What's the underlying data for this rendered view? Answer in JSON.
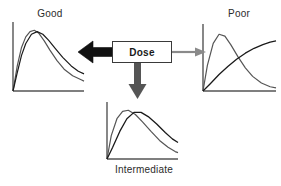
{
  "figure": {
    "title": "",
    "center_node": {
      "label": "Dose",
      "border_color": "#3a3a3a",
      "fill_color": "#ffffff"
    }
  },
  "arrows": [
    {
      "name": "arrow-to-good",
      "direction": "left",
      "style": "thick-solid",
      "color": "#111111",
      "target": "Good"
    },
    {
      "name": "arrow-to-poor",
      "direction": "right",
      "style": "thin",
      "color": "#8a8a8a",
      "target": "Poor"
    },
    {
      "name": "arrow-to-intermediate",
      "direction": "down",
      "style": "medium",
      "color": "#555555",
      "target": "Intermediate"
    }
  ],
  "panels": [
    {
      "id": "good",
      "label": "Good"
    },
    {
      "id": "poor",
      "label": "Poor"
    },
    {
      "id": "intermediate",
      "label": "Intermediate"
    }
  ],
  "chart_data": [
    {
      "id": "good",
      "type": "line",
      "title": "Good",
      "xlabel": "",
      "ylabel": "",
      "grid": false,
      "legend": "none",
      "axes": {
        "x_axis": true,
        "y_axis": true,
        "ticks": false
      },
      "xlim": [
        0,
        100
      ],
      "ylim": [
        0,
        100
      ],
      "annotation": "Two concentration-time curves peak at nearly the same time and height (overlapping response).",
      "series": [
        {
          "name": "curve-1",
          "color": "#555555",
          "x": [
            0,
            6,
            12,
            18,
            24,
            30,
            36,
            44,
            52,
            62,
            72,
            84,
            96,
            100
          ],
          "y": [
            0,
            38,
            66,
            82,
            90,
            92,
            88,
            76,
            62,
            46,
            33,
            23,
            17,
            15
          ]
        },
        {
          "name": "curve-2",
          "color": "#1a1a1a",
          "x": [
            0,
            6,
            12,
            18,
            26,
            34,
            42,
            50,
            60,
            70,
            82,
            92,
            100
          ],
          "y": [
            0,
            28,
            54,
            72,
            86,
            90,
            86,
            77,
            64,
            51,
            38,
            30,
            26
          ]
        }
      ]
    },
    {
      "id": "poor",
      "type": "line",
      "title": "Poor",
      "xlabel": "",
      "ylabel": "",
      "grid": false,
      "legend": "none",
      "axes": {
        "x_axis": true,
        "y_axis": true,
        "ticks": false
      },
      "xlim": [
        0,
        100
      ],
      "ylim": [
        0,
        100
      ],
      "annotation": "One curve peaks early then falls to near zero; the other rises slowly and plateaus high (curves cross).",
      "series": [
        {
          "name": "curve-peak-early",
          "color": "#555555",
          "x": [
            0,
            6,
            14,
            22,
            30,
            38,
            48,
            58,
            68,
            80,
            92,
            100
          ],
          "y": [
            0,
            42,
            78,
            93,
            90,
            76,
            56,
            38,
            24,
            13,
            7,
            5
          ]
        },
        {
          "name": "curve-slow-rise",
          "color": "#1a1a1a",
          "x": [
            0,
            10,
            22,
            34,
            46,
            58,
            70,
            82,
            92,
            100
          ],
          "y": [
            0,
            12,
            27,
            40,
            52,
            62,
            70,
            76,
            80,
            82
          ]
        }
      ]
    },
    {
      "id": "intermediate",
      "type": "line",
      "title": "Intermediate",
      "xlabel": "",
      "ylabel": "",
      "grid": false,
      "legend": "none",
      "axes": {
        "x_axis": true,
        "y_axis": true,
        "ticks": false
      },
      "xlim": [
        0,
        100
      ],
      "ylim": [
        0,
        100
      ],
      "annotation": "Two curves with moderately offset peaks that partially overlap.",
      "series": [
        {
          "name": "curve-early",
          "color": "#555555",
          "x": [
            0,
            6,
            14,
            22,
            30,
            40,
            50,
            62,
            74,
            86,
            96,
            100
          ],
          "y": [
            0,
            44,
            76,
            90,
            92,
            84,
            70,
            52,
            35,
            22,
            14,
            12
          ]
        },
        {
          "name": "curve-late",
          "color": "#1a1a1a",
          "x": [
            0,
            8,
            18,
            28,
            38,
            48,
            58,
            70,
            82,
            92,
            100
          ],
          "y": [
            0,
            22,
            52,
            76,
            88,
            88,
            80,
            66,
            50,
            38,
            31
          ]
        }
      ]
    }
  ]
}
